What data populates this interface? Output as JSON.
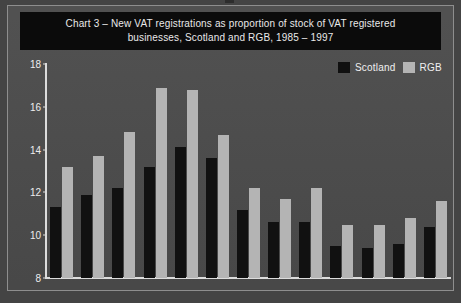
{
  "chart_data": {
    "type": "bar",
    "title": "Chart 3 – New VAT registrations as proportion of stock of VAT registered\nbusinesses, Scotland and RGB, 1985 – 1997",
    "title_line1": "Chart 3 – New VAT registrations as proportion of stock of VAT registered",
    "title_line2": "businesses, Scotland and RGB, 1985 – 1997",
    "xlabel": "",
    "ylabel": "",
    "categories": [
      "1985",
      "1986",
      "1987",
      "1988",
      "1989",
      "1990",
      "1991",
      "1992",
      "1993",
      "1994",
      "1995",
      "1996",
      "1997"
    ],
    "series": [
      {
        "name": "Scotland",
        "color": "#111111",
        "values": [
          11.3,
          11.9,
          12.2,
          13.2,
          14.1,
          13.6,
          11.2,
          10.6,
          10.6,
          9.5,
          9.4,
          9.6,
          10.4
        ]
      },
      {
        "name": "RGB",
        "color": "#b4b4b4",
        "values": [
          13.2,
          13.7,
          14.8,
          16.9,
          16.8,
          14.7,
          12.2,
          11.7,
          12.2,
          10.5,
          10.5,
          10.8,
          11.6
        ]
      }
    ],
    "ylim": [
      8,
      18
    ],
    "yticks": [
      18,
      16,
      14,
      12,
      10,
      8
    ],
    "grid": false,
    "legend_position": "top-right"
  },
  "legend": {
    "items": [
      {
        "label": "Scotland",
        "swatch_class": "scotland"
      },
      {
        "label": "RGB",
        "swatch_class": "rgb"
      }
    ]
  },
  "caption": {
    "source": ""
  },
  "colors": {
    "page_background": "#444444",
    "card_background": "#4b4b4b",
    "card_border": "#8e8e8e",
    "title_band": "#0b0b0b",
    "title_text": "#e9e9e9",
    "axis": "#dcdcdc",
    "tick_text": "#ededed",
    "series_scotland": "#111111",
    "series_rgb": "#b4b4b4"
  }
}
